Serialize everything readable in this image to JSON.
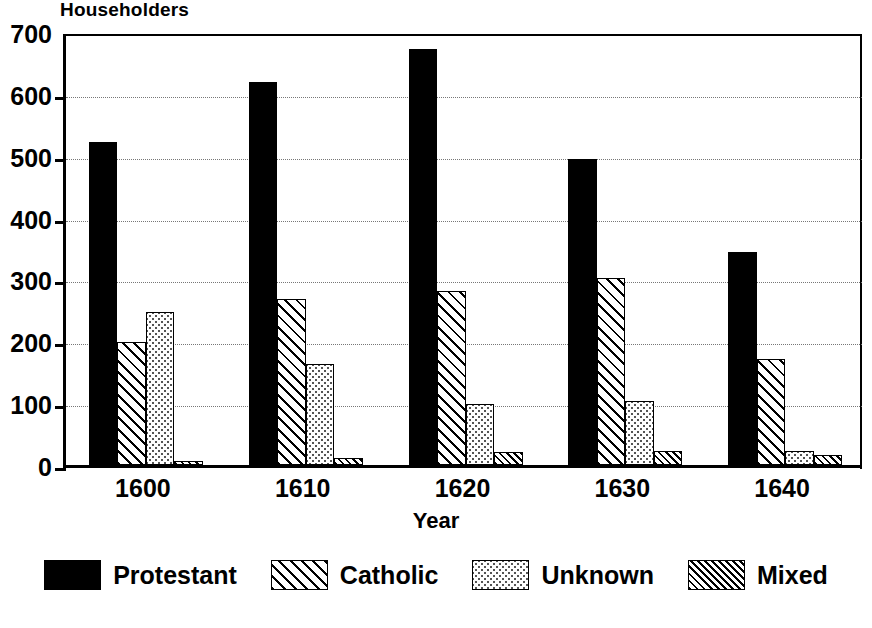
{
  "chart_data": {
    "type": "bar",
    "title": "Householders",
    "xlabel": "Year",
    "ylabel": "",
    "categories": [
      "1600",
      "1610",
      "1620",
      "1630",
      "1640"
    ],
    "series": [
      {
        "name": "Protestant",
        "pattern": "solid-black",
        "color": "#000000",
        "values": [
          522,
          620,
          672,
          495,
          345
        ]
      },
      {
        "name": "Catholic",
        "pattern": "diagonal-wide",
        "color": "#000000",
        "values": [
          199,
          268,
          282,
          303,
          172
        ]
      },
      {
        "name": "Unknown",
        "pattern": "stipple-dots",
        "color": "#555555",
        "values": [
          248,
          163,
          99,
          104,
          22
        ]
      },
      {
        "name": "Mixed",
        "pattern": "diagonal-dense",
        "color": "#000000",
        "values": [
          6,
          12,
          21,
          23,
          16
        ]
      }
    ],
    "ylim": [
      0,
      700
    ],
    "yticks": [
      0,
      100,
      200,
      300,
      400,
      500,
      600,
      700
    ],
    "ytick_labels": [
      "0",
      "100",
      "200",
      "300",
      "400",
      "500",
      "600",
      "700"
    ],
    "grid": true,
    "grid_style": "dotted-horizontal",
    "legend_position": "bottom",
    "legend_entries": [
      "Protestant",
      "Catholic",
      "Unknown",
      "Mixed"
    ]
  }
}
